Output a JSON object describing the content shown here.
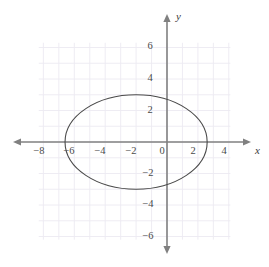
{
  "figure": {
    "background_color": "#ffffff",
    "axis_color": "#808080",
    "grid_color": "#eceaf2",
    "curve_color": "#4a4a4a",
    "label_color": "#4a4a4a"
  },
  "chart_data": {
    "type": "line",
    "title": "",
    "subtitle": "",
    "xlabel": "x",
    "ylabel": "y",
    "grid": true,
    "legend": [],
    "legend_position": "none",
    "xlim": [
      -8.4,
      4.4
    ],
    "ylim": [
      -6.6,
      6.6
    ],
    "x_ticks": [
      -8,
      -6,
      -4,
      -2,
      0,
      2,
      4
    ],
    "x_tick_labels": [
      "−8",
      "−6",
      "−4",
      "−2",
      "0",
      "2",
      "4"
    ],
    "y_ticks": [
      6,
      4,
      2,
      -2,
      -4,
      -6
    ],
    "y_tick_labels": [
      "6",
      "4",
      "2",
      "−2",
      "−4",
      "−6"
    ],
    "grid_x_range": [
      -8.3,
      4.1
    ],
    "grid_y_range": [
      -6.2,
      6.3
    ],
    "grid_step": 1,
    "annotations": [],
    "series": [
      {
        "name": "ellipse",
        "shape": "ellipse",
        "center": [
          -2,
          0
        ],
        "semi_axis_x": 4.6,
        "semi_axis_y": 3,
        "x_intercepts": [
          -6.6,
          2.3
        ],
        "y_extremes": [
          3,
          -3
        ],
        "equation": "(x + 2)^2 / 4.6^2 + y^2 / 3^2 = 1",
        "color": "#4a4a4a",
        "line_width": 1.1
      }
    ]
  },
  "axis_labels": {
    "x_axis_name": "x",
    "y_axis_name": "y"
  }
}
